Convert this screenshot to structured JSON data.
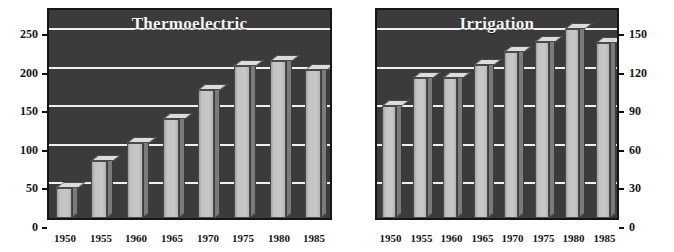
{
  "figure": {
    "axis_caption_fragment": "ay",
    "background_color": "#ffffff",
    "plot_background_color": "#3b3b3b",
    "gridline_color": "#f0f0f0",
    "bar_face_color": "#c4c4c4",
    "bar_side_color": "#7b7b7b",
    "bar_top_color": "#dcdcdc",
    "title_color": "#f2f2f2",
    "tick_color": "#141414"
  },
  "chart_data": [
    {
      "type": "bar",
      "title": "Thermoelectric",
      "xlabel": "",
      "ylabel": "",
      "ylim": [
        0,
        275
      ],
      "yticks": [
        0,
        50,
        100,
        150,
        200,
        250
      ],
      "ytick_labels": [
        "0",
        "50",
        "100",
        "150",
        "200",
        "250"
      ],
      "yaxis_side": "left",
      "grid": true,
      "legend": "none",
      "categories": [
        "1950",
        "1955",
        "1960",
        "1965",
        "1970",
        "1975",
        "1980",
        "1985"
      ],
      "values": [
        40,
        75,
        98,
        130,
        168,
        198,
        205,
        193
      ]
    },
    {
      "type": "bar",
      "title": "Irrigation",
      "xlabel": "",
      "ylabel": "",
      "ylim": [
        0,
        165
      ],
      "yticks": [
        0,
        30,
        60,
        90,
        120,
        150
      ],
      "ytick_labels": [
        "0",
        "30",
        "60",
        "90",
        "120",
        "150"
      ],
      "yaxis_side": "right",
      "grid": true,
      "legend": "none",
      "categories": [
        "1950",
        "1955",
        "1960",
        "1965",
        "1970",
        "1975",
        "1980",
        "1985"
      ],
      "values": [
        88,
        110,
        110,
        120,
        130,
        138,
        148,
        137
      ]
    }
  ]
}
